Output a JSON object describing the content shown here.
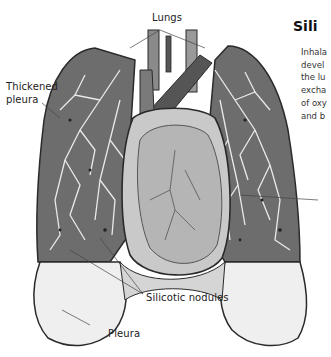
{
  "illustration": {
    "subject": "lungs-with-silicosis",
    "labels": {
      "lungs": "Lungs",
      "thickened_pleura_line1": "Thickened",
      "thickened_pleura_line2": "pleura",
      "silicotic_nodules": "Silicotic nodules",
      "pleura": "Pleura"
    }
  },
  "article": {
    "title": "Sili",
    "body_lines": [
      "Inhala",
      "devel",
      "the lu",
      "excha",
      "of oxy",
      "and b"
    ]
  },
  "colors": {
    "lung_tissue": "#6a6a6a",
    "airway": "#e8e8e8",
    "heart": "#bdbdbd",
    "pleura": "#efefef",
    "outline": "#2a2a2a"
  }
}
